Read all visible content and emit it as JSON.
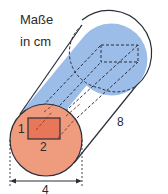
{
  "units": {
    "line1": "Maße",
    "line2": "in cm"
  },
  "labels": {
    "rect_height": "1",
    "rect_width": "2",
    "length": "8",
    "diameter": "4"
  },
  "colors": {
    "cylinder_body": "#9dbde9",
    "front_face": "#ef9b7e",
    "rectangle_fill": "#e8775a",
    "outline": "#2a2f3a"
  }
}
